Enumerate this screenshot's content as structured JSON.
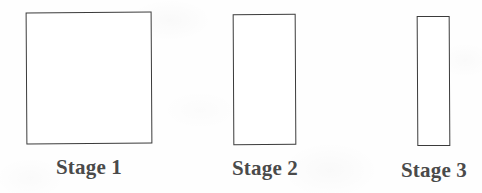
{
  "figure": {
    "background_color": "#fefefe",
    "stroke_color": "#3b3b3b",
    "label_color": "#4a4a4a"
  },
  "chart_data": {
    "type": "bar",
    "title": "",
    "xlabel": "",
    "ylabel": "",
    "categories": [
      "Stage 1",
      "Stage 2",
      "Stage 3"
    ],
    "series": [
      {
        "name": "width",
        "values": [
          126,
          63,
          33
        ]
      },
      {
        "name": "height",
        "values": [
          132,
          131,
          130
        ]
      }
    ],
    "grid": false,
    "legend": "none",
    "annotations": []
  },
  "stages": [
    {
      "label": "Stage 1",
      "shape": "rectangle",
      "width": 126,
      "height": 132
    },
    {
      "label": "Stage 2",
      "shape": "rectangle",
      "width": 63,
      "height": 131
    },
    {
      "label": "Stage 3",
      "shape": "rectangle",
      "width": 33,
      "height": 130
    }
  ]
}
